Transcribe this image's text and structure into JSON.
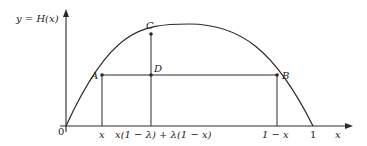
{
  "diagram": {
    "type": "function-graph",
    "y_axis_label": "y = H(x)",
    "x_axis_label": "x",
    "origin_label": "0",
    "x_ticks": [
      {
        "label": "x"
      },
      {
        "label": "x(1 − λ) + λ(1 − x)"
      },
      {
        "label": "1 − x"
      },
      {
        "label": "1"
      }
    ],
    "points": [
      {
        "name": "A"
      },
      {
        "name": "B"
      },
      {
        "name": "C"
      },
      {
        "name": "D"
      }
    ],
    "curve": "concave arch from 0 to 1, peak near x = 1/2",
    "colors": {
      "stroke": "#2a2a2a",
      "background": "#ffffff"
    }
  }
}
